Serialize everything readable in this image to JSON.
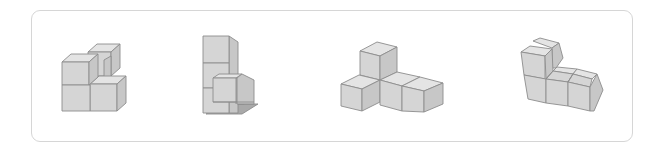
{
  "figure_panel": {
    "description": "Four isometric cube-block figures in a rounded frame",
    "figures": [
      {
        "id": "figure-1",
        "cube_count": 5,
        "shape": "compact cluster with raised back cube"
      },
      {
        "id": "figure-2",
        "cube_count": 5,
        "shape": "tall column of three with front step"
      },
      {
        "id": "figure-3",
        "cube_count": 5,
        "shape": "T/L shape with one raised cube"
      },
      {
        "id": "figure-4",
        "cube_count": 6,
        "shape": "L-shaped wall of stacked cubes"
      }
    ],
    "colors": {
      "top": "#e4e4e4",
      "front": "#d5d5d5",
      "side": "#c7c7c7",
      "shadow": "#a9a9a9",
      "edge": "#8c8c8c",
      "frame_border": "#d6d6d6"
    }
  }
}
